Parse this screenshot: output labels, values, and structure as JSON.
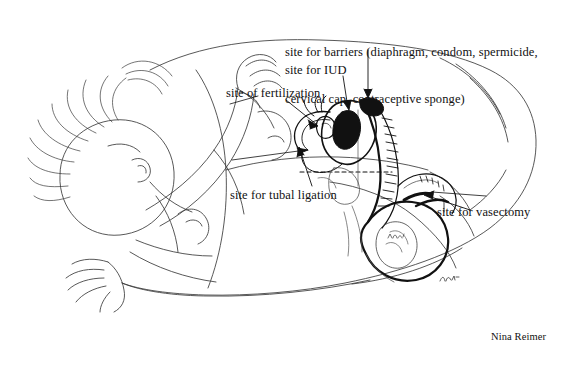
{
  "figure": {
    "background_color": "#ffffff",
    "ink_color": "#111111",
    "width": 584,
    "height": 367
  },
  "labels": {
    "barriers_line1": "site for barriers (diaphragm, condom, spermicide,",
    "barriers_line2": "cervical cap, contraceptive sponge)",
    "iud": "site for IUD",
    "fertilization": "site of fertilization",
    "tubal_ligation": "site for tubal ligation",
    "vasectomy": "site for vasectomy"
  },
  "credit": {
    "artist": "Nina Reimer"
  },
  "artwork": {
    "description": "Pen-and-ink line drawing of an embracing couple lying down, with a cut-away anatomical cross-section of the female and male reproductive tracts overlaid at the pelvis.",
    "style": "line-art",
    "elements": [
      "female-figure-head-and-hair",
      "female-figure-arms-and-hands",
      "male-figure-torso-and-legs",
      "pelvic-cross-section",
      "uterus",
      "fallopian-tube",
      "ovary",
      "cervix-and-vagina",
      "testis-and-vas-deferens",
      "dashed-cutaway-line",
      "leader-lines-with-arrowheads"
    ]
  }
}
